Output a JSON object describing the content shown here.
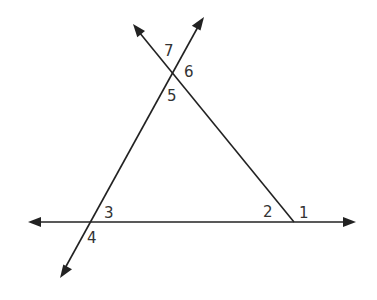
{
  "diagram": {
    "type": "triangle formed by three intersecting lines",
    "line_color": "#222222",
    "label_color": "#333333",
    "angles": [
      {
        "id": "1",
        "label": "1",
        "x": 299,
        "y": 218
      },
      {
        "id": "2",
        "label": "2",
        "x": 263,
        "y": 217
      },
      {
        "id": "3",
        "label": "3",
        "x": 104,
        "y": 218
      },
      {
        "id": "4",
        "label": "4",
        "x": 87,
        "y": 243
      },
      {
        "id": "5",
        "label": "5",
        "x": 167,
        "y": 101
      },
      {
        "id": "6",
        "label": "6",
        "x": 184,
        "y": 77
      },
      {
        "id": "7",
        "label": "7",
        "x": 164,
        "y": 56
      }
    ]
  }
}
